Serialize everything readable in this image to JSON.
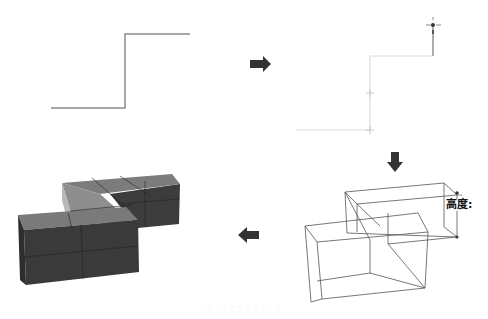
{
  "diagram": {
    "steps": [
      {
        "id": 1,
        "name": "step-line-profile",
        "description": "2D stepped line profile"
      },
      {
        "id": 2,
        "name": "step-extrude-height",
        "description": "Line selected, dragging height with move cursor"
      },
      {
        "id": 3,
        "name": "step-wireframe",
        "description": "Extruded wireframe boxes with height label"
      },
      {
        "id": 4,
        "name": "step-solid-mesh",
        "description": "Solid shaded mesh result"
      }
    ],
    "arrows": [
      {
        "from": 1,
        "to": 2,
        "direction": "right"
      },
      {
        "from": 2,
        "to": 3,
        "direction": "down"
      },
      {
        "from": 3,
        "to": 4,
        "direction": "left"
      }
    ],
    "height_label": "高度:",
    "caption": "· · · · · · · · · · ·",
    "colors": {
      "line": "#8a8a8a",
      "faint_line": "#d8d8d8",
      "wire": "#555555",
      "arrow": "#333333",
      "solid_front": "#3a3a3a",
      "solid_top": "#7a7a7a",
      "solid_light": "#b5b5b5"
    }
  }
}
